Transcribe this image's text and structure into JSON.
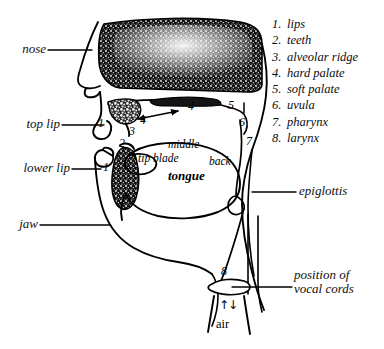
{
  "figure": {
    "background": "#ffffff",
    "ink": "#000000"
  },
  "legend": {
    "items": [
      {
        "number": "1.",
        "label": "lips"
      },
      {
        "number": "2.",
        "label": "teeth"
      },
      {
        "number": "3.",
        "label": "alveolar ridge"
      },
      {
        "number": "4.",
        "label": "hard palate"
      },
      {
        "number": "5.",
        "label": "soft palate"
      },
      {
        "number": "6.",
        "label": "uvula"
      },
      {
        "number": "7.",
        "label": "pharynx"
      },
      {
        "number": "8.",
        "label": "larynx"
      }
    ]
  },
  "callouts": {
    "nose": "nose",
    "top_lip": "top lip",
    "lower_lip": "lower lip",
    "jaw": "jaw",
    "epiglottis": "epiglottis",
    "vocal_cords_line1": "position of",
    "vocal_cords_line2": "vocal cords",
    "air": "air"
  },
  "tongue_regions": {
    "tip_blade": "tip blade",
    "middle": "middle",
    "back": "back",
    "tongue": "tongue"
  },
  "markers": {
    "top_lip_1": "1",
    "lower_lip_1": "1",
    "teeth_2": "2",
    "alveolar_3": "3",
    "hard_palate_4a": "4",
    "hard_palate_4b": "4",
    "soft_palate_5": "5",
    "uvula_6": "6",
    "pharynx_7": "7",
    "larynx_8": "8"
  },
  "airflow": {
    "arrow_glyphs": "↑↓"
  }
}
